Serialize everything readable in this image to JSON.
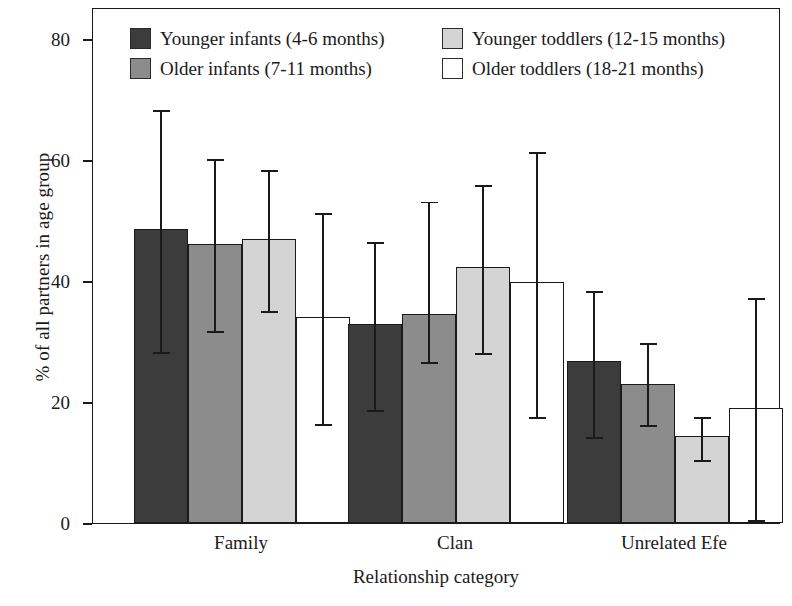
{
  "chart_data": {
    "type": "bar",
    "title": "",
    "subtitle": "",
    "xlabel": "Relationship category",
    "ylabel": "% of all partners in age group",
    "categories": [
      "Family",
      "Clan",
      "Unrelated Efe"
    ],
    "ylim": [
      0,
      84
    ],
    "yticks": [
      0,
      20,
      40,
      60,
      80
    ],
    "ytick_labels": [
      "0",
      "20",
      "40",
      "60",
      "80"
    ],
    "grid": false,
    "legend_position": "top-inside",
    "orientation": "vertical",
    "error_bars": true,
    "series": [
      {
        "name": "Younger infants (4-6 months)",
        "color": "#3c3c3c",
        "values": [
          48.6,
          32.9,
          26.8
        ],
        "err_low": [
          28.4,
          18.8,
          14.4
        ],
        "err_high": [
          68.4,
          46.6,
          38.5
        ]
      },
      {
        "name": "Older infants (7-11 months)",
        "color": "#8c8c8c",
        "values": [
          46.2,
          34.5,
          23.0
        ],
        "err_low": [
          31.9,
          26.8,
          16.4
        ],
        "err_high": [
          60.3,
          53.3,
          29.9
        ]
      },
      {
        "name": "Younger toddlers (12-15 months)",
        "color": "#d4d4d4",
        "values": [
          47.0,
          42.3,
          14.4
        ],
        "err_low": [
          35.2,
          28.3,
          10.6
        ],
        "err_high": [
          58.5,
          56.0,
          17.7
        ]
      },
      {
        "name": "Older toddlers (18-21 months)",
        "color": "#ffffff",
        "values": [
          34.0,
          39.8,
          19.0
        ],
        "err_low": [
          16.5,
          17.7,
          0.7
        ],
        "err_high": [
          51.4,
          61.5,
          37.4
        ]
      }
    ]
  },
  "legend": {
    "items": [
      {
        "label": "Younger infants (4-6 months)",
        "color": "#3c3c3c"
      },
      {
        "label": "Younger toddlers (12-15 months)",
        "color": "#d4d4d4"
      },
      {
        "label": "Older infants (7-11 months)",
        "color": "#8c8c8c"
      },
      {
        "label": "Older toddlers (18-21 months)",
        "color": "#ffffff"
      }
    ]
  },
  "axes": {
    "y_title": "% of all partners in age group",
    "x_title": "Relationship category",
    "y_tick_labels": [
      "80",
      "60",
      "40",
      "20",
      "0"
    ],
    "x_tick_labels": [
      "Family",
      "Clan",
      "Unrelated Efe"
    ]
  },
  "colors": {
    "axis": "#1a1a1a",
    "background": "#ffffff",
    "series_1": "#3c3c3c",
    "series_2": "#8c8c8c",
    "series_3": "#d4d4d4",
    "series_4": "#ffffff"
  }
}
